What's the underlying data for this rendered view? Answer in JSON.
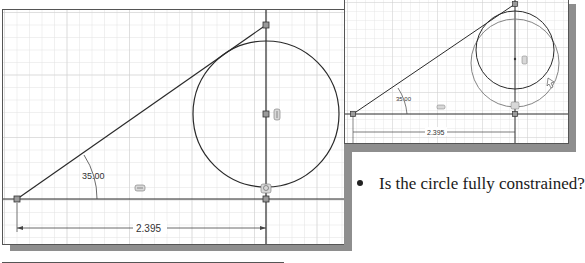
{
  "left_view": {
    "angle_dimension": "35.00",
    "linear_dimension": "2.395",
    "constraint_glyph_horizontal": "horizontal-constraint",
    "constraint_glyph_tangent": "tangent-constraint",
    "constraint_glyph_vertical": "vertical-constraint"
  },
  "right_view": {
    "angle_dimension": "35.00",
    "linear_dimension": "2.395",
    "drag_cursor": "drag-circle-cursor"
  },
  "caption": {
    "text": "Is the circle fully constrained?"
  },
  "colors": {
    "grid_minor": "#e2e2e2",
    "grid_major": "#c9c9c9",
    "geometry": "#2a2a2a",
    "shadow": "#8e8e8e",
    "point": "#9a9a9a"
  }
}
